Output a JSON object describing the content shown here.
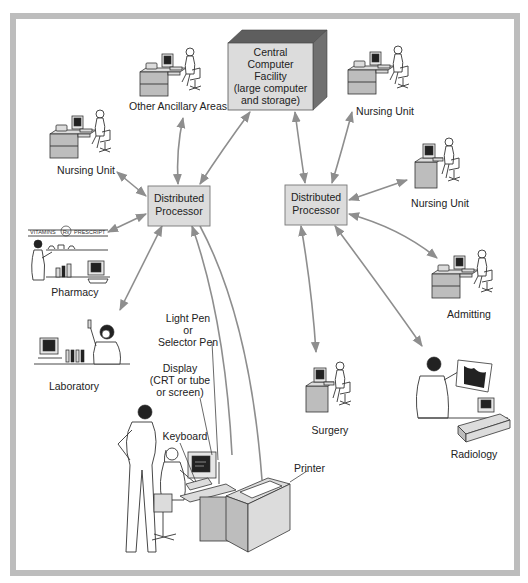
{
  "diagram": {
    "type": "hospital-information-system-network",
    "central_facility": {
      "lines": [
        "Central",
        "Computer",
        "Facility",
        "(large computer",
        "and storage)"
      ]
    },
    "distributed_processors": [
      {
        "id": "dp-left",
        "lines": [
          "Distributed",
          "Processor"
        ]
      },
      {
        "id": "dp-right",
        "lines": [
          "Distributed",
          "Processor"
        ]
      }
    ],
    "stations": {
      "other_ancillary_areas": "Other Ancillary Areas",
      "nursing_unit_top_right": "Nursing Unit",
      "nursing_unit_left": "Nursing Unit",
      "nursing_unit_right": "Nursing Unit",
      "pharmacy": "Pharmacy",
      "laboratory": "Laboratory",
      "admitting": "Admitting",
      "surgery": "Surgery",
      "radiology": "Radiology"
    },
    "pharmacy_sign": {
      "left": "VITAMINS",
      "center": "Rx",
      "right": "PRESCRIPT"
    },
    "terminal_callouts": {
      "light_pen": [
        "Light Pen",
        "or",
        "Selector Pen"
      ],
      "display": [
        "Display",
        "(CRT or tube",
        "or screen)"
      ],
      "keyboard": "Keyboard",
      "printer": "Printer"
    },
    "connections": [
      {
        "from": "Central Computer Facility",
        "to": "Distributed Processor (left)"
      },
      {
        "from": "Central Computer Facility",
        "to": "Distributed Processor (right)"
      },
      {
        "from": "Central Computer Facility",
        "to": "Nursing Unit (top right)"
      },
      {
        "from": "Distributed Processor (left)",
        "to": "Other Ancillary Areas"
      },
      {
        "from": "Distributed Processor (left)",
        "to": "Nursing Unit (left)"
      },
      {
        "from": "Distributed Processor (left)",
        "to": "Pharmacy"
      },
      {
        "from": "Distributed Processor (left)",
        "to": "Laboratory"
      },
      {
        "from": "Distributed Processor (left)",
        "to": "Terminal (display/keyboard/light pen)"
      },
      {
        "from": "Distributed Processor (left)",
        "to": "Printer"
      },
      {
        "from": "Distributed Processor (right)",
        "to": "Nursing Unit (right)"
      },
      {
        "from": "Distributed Processor (right)",
        "to": "Admitting"
      },
      {
        "from": "Distributed Processor (right)",
        "to": "Surgery"
      },
      {
        "from": "Distributed Processor (right)",
        "to": "Radiology"
      }
    ],
    "colors": {
      "frame": "#bdbdbd",
      "box_face": "#dcdcdc",
      "box_side_dark": "#6e6e6e",
      "arrow": "#8e8e8e",
      "text": "#222222"
    }
  }
}
